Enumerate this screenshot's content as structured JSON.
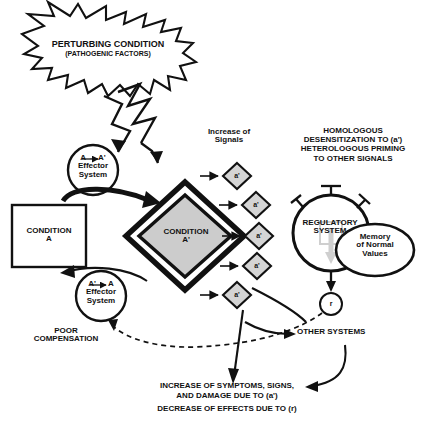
{
  "diagram": {
    "title_region": {
      "perturbing_condition": "PERTURBING CONDITION",
      "pathogenic_factors": "(PATHOGENIC FACTORS)"
    },
    "condition_a": {
      "line1": "CONDITION",
      "line2": "A"
    },
    "condition_a_prime": {
      "line1": "CONDITION",
      "line2": "A'"
    },
    "effector_top": {
      "line1": "A → A'",
      "line2": "Effector",
      "line3": "System"
    },
    "effector_bottom": {
      "line1": "A' → A",
      "line2": "Effector",
      "line3": "System"
    },
    "signals": {
      "line1": "Increase of",
      "line2": "Signals",
      "node_label": "a'",
      "nodes": [
        {
          "label": "a'"
        },
        {
          "label": "a'"
        },
        {
          "label": "a'"
        },
        {
          "label": "a'"
        },
        {
          "label": "a'"
        }
      ]
    },
    "desensitization": {
      "line1": "HOMOLOGOUS",
      "line2": "DESENSITIZATION TO (a')",
      "line3": "HETEROLOGOUS PRIMING",
      "line4": "TO OTHER SIGNALS"
    },
    "regulatory_system": {
      "line1": "REGULATORY",
      "line2": "SYSTEM"
    },
    "memory": {
      "line1": "Memory",
      "line2": "of Normal",
      "line3": "Values"
    },
    "receptor_output": {
      "label": "r"
    },
    "poor_compensation": {
      "line1": "POOR",
      "line2": "COMPENSATION"
    },
    "other_systems": {
      "label": "OTHER SYSTEMS"
    },
    "outcome": {
      "line1": "INCREASE OF SYMPTOMS, SIGNS,",
      "line2": "AND DAMAGE DUE TO (a')",
      "line3": "DECREASE OF EFFECTS DUE TO (r)"
    },
    "colors": {
      "ink": "#111111",
      "diamond_fill": "#cccccc",
      "node_fill": "#d4d4d4",
      "paper": "#ffffff"
    }
  }
}
